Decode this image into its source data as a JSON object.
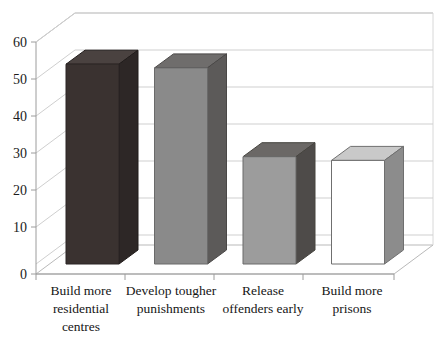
{
  "chart_data": {
    "type": "bar",
    "title": "",
    "subtitle": "",
    "xlabel": "",
    "ylabel": "",
    "categories": [
      "Build more residential centres",
      "Develop tougher punishments",
      "Release offenders early",
      "Build more prisons"
    ],
    "category_lines": [
      [
        "Build more",
        "residential",
        "centres"
      ],
      [
        "Develop tougher",
        "punishments"
      ],
      [
        "Release",
        "offenders early"
      ],
      [
        "Build more",
        "prisons"
      ]
    ],
    "values": [
      54,
      53,
      29,
      28
    ],
    "ylim": [
      0,
      60
    ],
    "yticks": [
      0,
      10,
      20,
      30,
      40,
      50,
      60
    ],
    "ytick_labels": [
      "0",
      "10",
      "20",
      "30",
      "40",
      "50",
      "60"
    ],
    "grid": true,
    "grid_axis": "y",
    "legend": false,
    "legend_position": "none",
    "three_d": true,
    "bar_colors": [
      "#3a3230",
      "#8a8a8a",
      "#9c9c9c",
      "#ffffff"
    ],
    "bar_side_colors": [
      "#2d2726",
      "#5c5a59",
      "#4e4b49",
      "#8c8c8c"
    ],
    "bar_top_colors": [
      "#4a4240",
      "#6f6d6c",
      "#6b6866",
      "#c9c9c9"
    ]
  },
  "axis": {
    "y_tick_0": "0",
    "y_tick_10": "10",
    "y_tick_20": "20",
    "y_tick_30": "30",
    "y_tick_40": "40",
    "y_tick_50": "50",
    "y_tick_60": "60"
  },
  "labels": {
    "cat0_line0": "Build more",
    "cat0_line1": "residential",
    "cat0_line2": "centres",
    "cat1_line0": "Develop tougher",
    "cat1_line1": "punishments",
    "cat2_line0": "Release",
    "cat2_line1": "offenders early",
    "cat3_line0": "Build more",
    "cat3_line1": "prisons"
  },
  "colors": {
    "background": "#ffffff",
    "grid": "#c8c8c8",
    "axis": "#9a9a9a",
    "text": "#1a1a1a"
  }
}
